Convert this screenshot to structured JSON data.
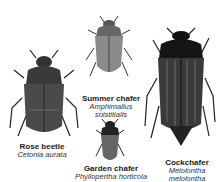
{
  "figure": {
    "specimens": [
      {
        "common": "Rose beetle",
        "scientific": "Cetonia aurata"
      },
      {
        "common": "Summer chafer",
        "scientific_1": "Amphimallus",
        "scientific_2": "solstitialis"
      },
      {
        "common": "Garden chafer",
        "scientific": "Phyllopertha horticola"
      },
      {
        "common": "Cockchafer",
        "scientific_1": "Melolontha",
        "scientific_2": "melolontha"
      }
    ]
  }
}
